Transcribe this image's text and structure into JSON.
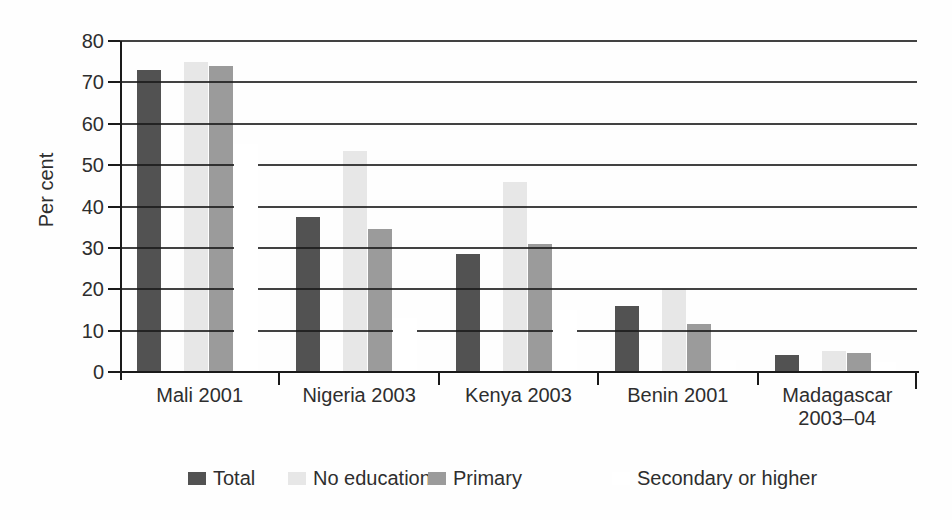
{
  "chart_data": {
    "type": "bar",
    "title": "",
    "xlabel": "",
    "ylabel": "Per cent",
    "ylim": [
      0,
      80
    ],
    "yticks": [
      0,
      10,
      20,
      30,
      40,
      50,
      60,
      70,
      80
    ],
    "grid": "horizontal",
    "legend_position": "bottom",
    "categories": [
      "Mali 2001",
      "Nigeria 2003",
      "Kenya 2003",
      "Benin 2001",
      "Madagascar 2003–04"
    ],
    "category_label_lines": [
      [
        "Mali 2001"
      ],
      [
        "Nigeria 2003"
      ],
      [
        "Kenya 2003"
      ],
      [
        "Benin 2001"
      ],
      [
        "Madagascar",
        "2003–04"
      ]
    ],
    "series": [
      {
        "name": "Total",
        "color": "#525252",
        "values": [
          73,
          37.5,
          28.5,
          16,
          4
        ]
      },
      {
        "name": "No education",
        "color": "#e7e7e7",
        "values": [
          75,
          53.5,
          46,
          20,
          5
        ]
      },
      {
        "name": "Primary",
        "color": "#9b9b9b",
        "values": [
          74,
          34.5,
          31,
          11.5,
          4.5
        ]
      },
      {
        "name": "Secondary or higher",
        "color": "#ffffff",
        "values": [
          55,
          13,
          15,
          3,
          2.5
        ]
      }
    ]
  }
}
